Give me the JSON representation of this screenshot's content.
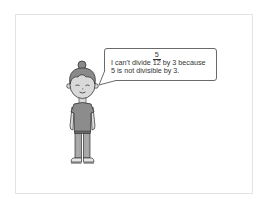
{
  "scene": {
    "background": "#ffffff",
    "frame_border": "#e3e3e3"
  },
  "speech_bubble": {
    "line1_prefix": "I can't divide ",
    "fraction": {
      "numerator": "5",
      "denominator": "12"
    },
    "line1_suffix": " by 3 because",
    "line2": "5 is not divisible by 3.",
    "border_color": "#6a6a6a"
  },
  "character": {
    "description": "cartoon girl with hair bun, standing, gray shirt and pants",
    "skin_color": "#d9d9d9",
    "hair_color": "#8a8a8a",
    "shirt_color": "#8c8c8c",
    "pants_color": "#a6a6a6",
    "outline_color": "#333333"
  }
}
